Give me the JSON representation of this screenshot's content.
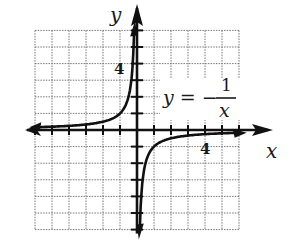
{
  "chart_data": {
    "type": "line",
    "title": "",
    "equation_label": {
      "lhs": "y = −",
      "numerator": "1",
      "denominator": "x"
    },
    "xlabel": "x",
    "ylabel": "y",
    "xlim": [
      -6,
      6
    ],
    "ylim": [
      -6,
      6
    ],
    "grid": true,
    "grid_step": 1,
    "x_tick_labels": [
      {
        "value": 4,
        "label": "4"
      }
    ],
    "y_tick_labels": [
      {
        "value": 4,
        "label": "4"
      }
    ],
    "series": [
      {
        "name": "y = -1/x (x < 0 branch)",
        "x": [
          -6,
          -5,
          -4,
          -3,
          -2,
          -1,
          -0.5,
          -0.25,
          -0.17
        ],
        "y": [
          0.167,
          0.2,
          0.25,
          0.333,
          0.5,
          1,
          2,
          4,
          6
        ]
      },
      {
        "name": "y = -1/x (x > 0 branch)",
        "x": [
          0.17,
          0.25,
          0.5,
          1,
          2,
          3,
          4,
          5,
          6
        ],
        "y": [
          -6,
          -4,
          -2,
          -1,
          -0.5,
          -0.333,
          -0.25,
          -0.2,
          -0.167
        ]
      }
    ],
    "asymptotes": {
      "vertical": 0,
      "horizontal": 0
    }
  },
  "labels": {
    "x_axis": "x",
    "y_axis": "y",
    "x_tick_4": "4",
    "y_tick_4": "4",
    "eq_lhs": "y = −",
    "eq_num": "1",
    "eq_den": "x"
  }
}
